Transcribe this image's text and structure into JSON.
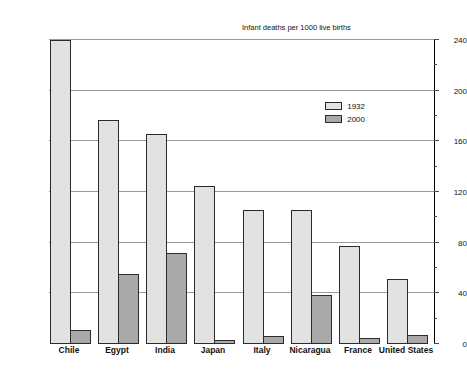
{
  "chart_data": {
    "type": "bar",
    "title": "",
    "xlabel": "",
    "ylabel": "Infant deaths per 1000 live births",
    "ylim": [
      0,
      240
    ],
    "yticks": [
      0,
      40,
      80,
      120,
      160,
      200,
      240
    ],
    "grid": true,
    "orientation": "vertical",
    "rotated_180": true,
    "legend_position": "inside-lower-left",
    "categories": [
      "United States",
      "France",
      "Nicaragua",
      "Italy",
      "Japan",
      "India",
      "Egypt",
      "Chile"
    ],
    "series": [
      {
        "name": "2000",
        "color": "#a9a9a9",
        "values": [
          7,
          5,
          39,
          6,
          3,
          72,
          55,
          11
        ]
      },
      {
        "name": "1932",
        "color": "#e2e2e2",
        "values": [
          51,
          77,
          106,
          106,
          125,
          166,
          177,
          240
        ]
      }
    ]
  },
  "legend": {
    "entries": [
      {
        "label": "2000",
        "swatch": "s2000"
      },
      {
        "label": "1932",
        "swatch": "s1932"
      }
    ]
  },
  "axis": {
    "title": "Infant deaths per 1000 live births",
    "tick_labels": [
      "0",
      "40",
      "80",
      "120",
      "160",
      "200",
      "240"
    ]
  }
}
